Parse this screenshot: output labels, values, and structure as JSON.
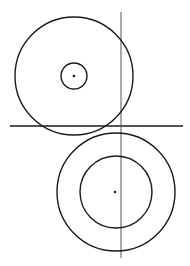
{
  "diagram": {
    "width": 190,
    "height": 266,
    "background": "#ffffff",
    "stroke_color": "#1a1a1a",
    "axis_color": "#555555",
    "upper_group": {
      "outer_circle": {
        "cx": 74,
        "cy": 76,
        "r": 59
      },
      "inner_circle": {
        "cx": 74,
        "cy": 76,
        "r": 13
      },
      "center_point": {
        "cx": 74,
        "cy": 76,
        "r": 1.3
      }
    },
    "lower_group": {
      "outer_circle": {
        "cx": 116,
        "cy": 192,
        "r": 59
      },
      "inner_circle": {
        "cx": 116,
        "cy": 192,
        "r": 36
      },
      "center_point": {
        "cx": 115,
        "cy": 192,
        "r": 1.3
      }
    },
    "lines": {
      "horizontal": {
        "x1": 10,
        "y1": 126,
        "x2": 183,
        "y2": 126
      },
      "vertical": {
        "x1": 121,
        "y1": 12,
        "x2": 121,
        "y2": 258
      }
    }
  }
}
